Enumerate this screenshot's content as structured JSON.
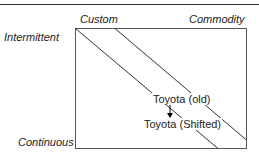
{
  "diagram": {
    "columns": {
      "left": "Custom",
      "right": "Commodity"
    },
    "rows": {
      "top": "Intermittent",
      "bottom": "Continuous"
    },
    "labels": {
      "old": "Toyota (old)",
      "shifted": "Toyota (Shifted)"
    },
    "colors": {
      "line": "#333333",
      "text": "#222222"
    }
  }
}
